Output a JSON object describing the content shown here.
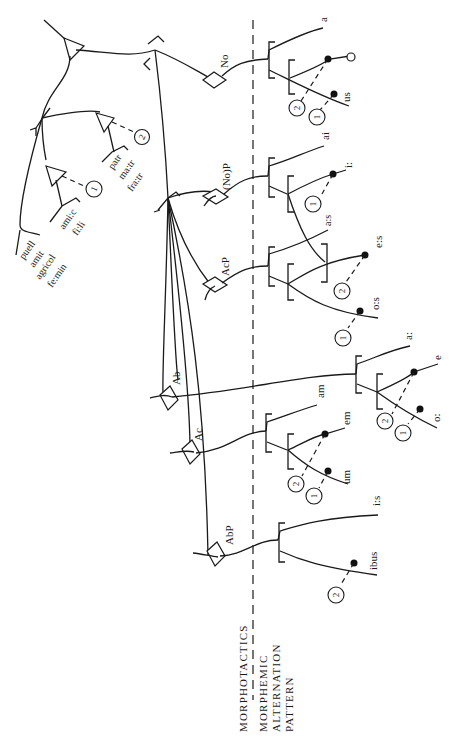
{
  "diagram": {
    "orientation": "rotated-90-ccw",
    "section_labels": {
      "top": "MORPHOTACTICS",
      "bottom_line1": "MORPHEMIC",
      "bottom_line2": "ALTERNATION",
      "bottom_line3": "PATTERN"
    },
    "stems": {
      "group_a": [
        "puell",
        "amit",
        "agricol",
        "fe:min"
      ],
      "group_b": [
        "ami:c",
        "fi:li"
      ],
      "group_c": [
        "patr",
        "ma:tr",
        "fra:tr"
      ]
    },
    "conditions": {
      "one": "1",
      "two": "2"
    },
    "cases": {
      "no": "No",
      "nop": "(No)P",
      "acp": "AcP",
      "ab": "Ab",
      "ac": "Ac",
      "abp": "AbP"
    },
    "endings": {
      "no": [
        "a",
        "us"
      ],
      "nop": [
        "ai",
        "i:"
      ],
      "acp": [
        "a:s",
        "e:s",
        "o:s"
      ],
      "ab": [
        "a:",
        "e",
        "o:"
      ],
      "ac": [
        "am",
        "em",
        "um"
      ],
      "abp": [
        "i:s",
        "ibus"
      ]
    }
  }
}
